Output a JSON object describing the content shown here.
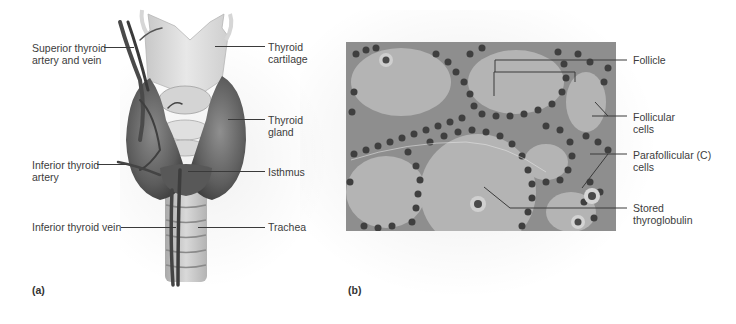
{
  "figure": {
    "panel_a": {
      "label": "(a)",
      "title": "Thyroid gland anatomy, anterior view",
      "callouts_left": [
        {
          "id": "superior-thyroid-artery-and-vein",
          "text": "Superior thyroid\nartery and vein"
        },
        {
          "id": "inferior-thyroid-artery",
          "text": "Inferior thyroid\nartery"
        },
        {
          "id": "inferior-thyroid-vein",
          "text": "Inferior thyroid vein"
        }
      ],
      "callouts_right": [
        {
          "id": "thyroid-cartilage",
          "text": "Thyroid\ncartilage"
        },
        {
          "id": "thyroid-gland",
          "text": "Thyroid\ngland"
        },
        {
          "id": "isthmus",
          "text": "Isthmus"
        },
        {
          "id": "trachea",
          "text": "Trachea"
        }
      ]
    },
    "panel_b": {
      "label": "(b)",
      "title": "Thyroid follicles micrograph",
      "callouts": [
        {
          "id": "follicle",
          "text": "Follicle"
        },
        {
          "id": "follicular-cells",
          "text": "Follicular\ncells"
        },
        {
          "id": "parafollicular-cells",
          "text": "Parafollicular (C)\ncells"
        },
        {
          "id": "stored-thyroglobulin",
          "text": "Stored\nthyroglobulin"
        }
      ]
    },
    "colors": {
      "text": "#3c3c3c",
      "leader": "#3a3a3a",
      "gland": "#5e5e5e",
      "cartilage": "#dcdcdc",
      "micrograph_bg": "#a9a9a9",
      "nucleus": "#3f3f3f"
    }
  }
}
